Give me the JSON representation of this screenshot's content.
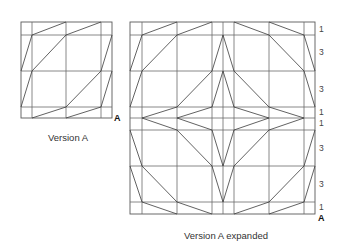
{
  "version_a": {
    "caption": "Version A",
    "corner_label": "A",
    "grid_x": [
      21,
      32,
      66,
      101,
      112
    ],
    "grid_y": [
      22,
      35,
      71,
      107,
      118
    ]
  },
  "version_a_expanded": {
    "caption": "Version A expanded",
    "corner_label": "A",
    "grid_x": [
      130,
      142,
      177,
      212,
      223,
      234,
      269,
      304,
      315
    ],
    "grid_y": [
      22,
      35,
      71,
      107,
      118,
      130,
      166,
      202,
      214
    ],
    "row_ratios": [
      "1",
      "3",
      "3",
      "1",
      "1",
      "3",
      "3",
      "1"
    ]
  },
  "colors": {
    "line": "#3a3a3a",
    "grid": "#6a6a6a",
    "text": "#333333"
  }
}
